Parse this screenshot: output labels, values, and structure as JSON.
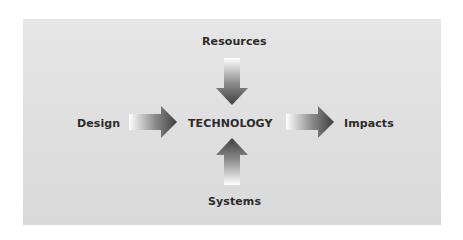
{
  "diagram": {
    "center": {
      "label": "TECHNOLOGY"
    },
    "nodes": {
      "top": {
        "label": "Resources",
        "direction": "inward"
      },
      "left": {
        "label": "Design",
        "direction": "inward"
      },
      "bottom": {
        "label": "Systems",
        "direction": "inward"
      },
      "right": {
        "label": "Impacts",
        "direction": "outward"
      }
    },
    "colors": {
      "background": "#e2e2e2",
      "text": "#2b2b2b",
      "arrow_dark": "#454545",
      "arrow_light": "#ffffff"
    }
  }
}
